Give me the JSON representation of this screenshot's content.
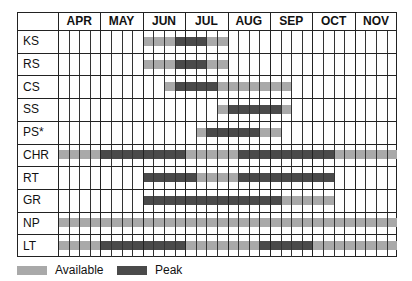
{
  "chart_data": {
    "type": "gantt",
    "title": "",
    "months": [
      "APR",
      "MAY",
      "JUN",
      "JUL",
      "AUG",
      "SEP",
      "OCT",
      "NOV"
    ],
    "weeks_per_month": 4,
    "rows": [
      {
        "label": "KS",
        "available": [
          [
            8,
            15
          ]
        ],
        "peak": [
          [
            11,
            13
          ]
        ]
      },
      {
        "label": "RS",
        "available": [
          [
            8,
            15
          ]
        ],
        "peak": [
          [
            11,
            13
          ]
        ]
      },
      {
        "label": "CS",
        "available": [
          [
            10,
            21
          ]
        ],
        "peak": [
          [
            11,
            14
          ]
        ]
      },
      {
        "label": "SS",
        "available": [
          [
            15,
            21
          ]
        ],
        "peak": [
          [
            16,
            20
          ]
        ]
      },
      {
        "label": "PS*",
        "available": [
          [
            13,
            20
          ]
        ],
        "peak": [
          [
            14,
            18
          ]
        ]
      },
      {
        "label": "CHR",
        "available": [
          [
            0,
            31
          ]
        ],
        "peak": [
          [
            4,
            11
          ],
          [
            17,
            25
          ]
        ]
      },
      {
        "label": "RT",
        "available": [
          [
            8,
            25
          ]
        ],
        "peak": [
          [
            8,
            12
          ],
          [
            17,
            25
          ]
        ]
      },
      {
        "label": "GR",
        "available": [
          [
            8,
            25
          ]
        ],
        "peak": [
          [
            8,
            20
          ]
        ]
      },
      {
        "label": "NP",
        "available": [
          [
            0,
            31
          ]
        ],
        "peak": []
      },
      {
        "label": "LT",
        "available": [
          [
            0,
            31
          ]
        ],
        "peak": [
          [
            4,
            11
          ],
          [
            19,
            23
          ]
        ]
      }
    ],
    "legend": [
      {
        "name": "Available",
        "color": "#a9a9a9"
      },
      {
        "name": "Peak",
        "color": "#4a4a4a"
      }
    ],
    "grid": true
  },
  "legend": {
    "available": "Available",
    "peak": "Peak"
  },
  "colors": {
    "available": "#a9a9a9",
    "peak": "#4a4a4a"
  }
}
